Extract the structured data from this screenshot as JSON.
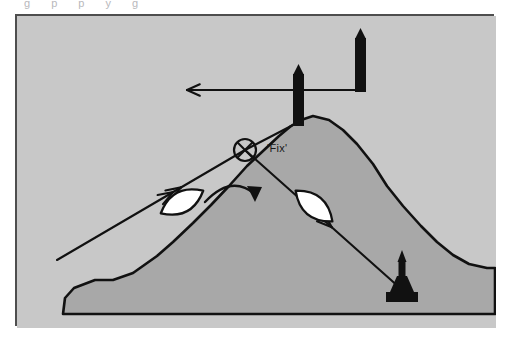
{
  "page": {
    "background_color": "#ffffff",
    "partial_caption_above": "g   p                       p   y       g"
  },
  "figure": {
    "frame": {
      "x": 15,
      "y": 14,
      "width": 479,
      "height": 312,
      "border_color": "#4e4e4e",
      "border_width": 2,
      "sea_color": "#c8c8c8"
    },
    "land": {
      "name": "island-headland",
      "fill_color": "#a8a8a8",
      "outline_color": "#111111",
      "path": "M 46 298 L 48 282 L 57 272 L 78 264 L 96 264 L 116 257 L 140 240 L 156 226 L 176 207 L 194 189 L 212 170 L 230 150 L 246 135 L 262 120 L 274 110 L 284 104 L 296 100 L 312 104 L 326 114 L 340 128 L 356 148 L 370 170 L 386 190 L 404 210 L 420 226 L 436 239 L 452 248 L 470 252 L 478 252 L 478 298 Z"
    },
    "bearing_lines": [
      {
        "name": "bearing-line-1",
        "description": "transit bearing from lower-left through fix to lighthouse at lower-right",
        "from": [
          55,
          244
        ],
        "to": [
          383,
          272
        ],
        "color": "#111111",
        "arrowheads": [
          "double-arrow-upper-left",
          "double-arrow-lower-right"
        ]
      },
      {
        "name": "bearing-line-2",
        "description": "bearing from left beacon down-left past fix, arrow to upper-left",
        "from": [
          170,
          74
        ],
        "to": [
          340,
          76
        ],
        "color": "#111111",
        "arrowheads": [
          "single-arrow-upper-left"
        ]
      }
    ],
    "fix_marker": {
      "name": "fix-symbol",
      "label": "'Fix'",
      "center": [
        228,
        134
      ],
      "radius": 11,
      "color": "#111111"
    },
    "beacons": [
      {
        "name": "beacon-left",
        "label": "",
        "x": 276,
        "base_y": 110,
        "top_y": 48,
        "width": 11
      },
      {
        "name": "beacon-right",
        "label": "",
        "x": 338,
        "base_y": 76,
        "top_y": 12,
        "width": 11
      }
    ],
    "lighthouse": {
      "name": "lighthouse-marker",
      "x": 385,
      "base_y": 286,
      "color": "#111111"
    },
    "vessels": [
      {
        "name": "vessel-first-position",
        "cx": 165,
        "cy": 186,
        "rx": 24,
        "ry": 12,
        "rotation": -28,
        "fill": "#ffffff",
        "stroke": "#111111"
      },
      {
        "name": "vessel-second-position",
        "cx": 297,
        "cy": 190,
        "rx": 24,
        "ry": 12,
        "rotation": 40,
        "fill": "#ffffff",
        "stroke": "#111111"
      }
    ],
    "course_change_arrow": {
      "name": "course-alteration-arrow",
      "description": "curved arrow showing alteration of course at the fix",
      "color": "#111111"
    }
  }
}
